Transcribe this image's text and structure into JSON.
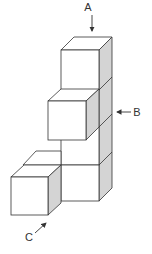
{
  "diagram": {
    "type": "isometric cube stack",
    "labels": {
      "a": "A",
      "b": "B",
      "c": "C"
    },
    "colors": {
      "face_front": "#ffffff",
      "face_top": "#ffffff",
      "face_side": "#d4d4d4",
      "stroke": "#333333"
    },
    "cube_count": 6
  }
}
